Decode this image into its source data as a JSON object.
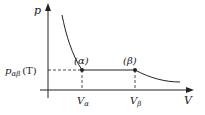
{
  "diagram": {
    "type": "phase-coexistence p-V isotherm",
    "axes": {
      "y_label": "p",
      "x_label": "V"
    },
    "pressure_level": {
      "label_main": "p",
      "label_sub": "αβ",
      "label_arg": "(T)"
    },
    "points": [
      {
        "label": "(α)",
        "volume_label_main": "V",
        "volume_label_sub": "α"
      },
      {
        "label": "(β)",
        "volume_label_main": "V",
        "volume_label_sub": "β"
      }
    ],
    "colors": {
      "line": "#222222",
      "background": "#ffffff"
    }
  }
}
